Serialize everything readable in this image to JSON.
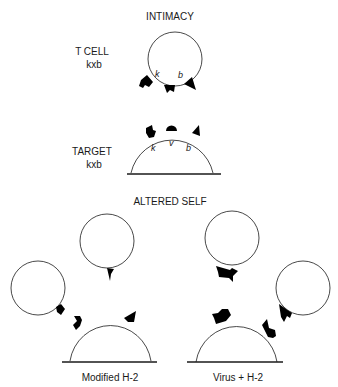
{
  "title": "INTIMACY",
  "intimacy": {
    "tcell": {
      "label_line1": "T CELL",
      "label_line2": "kxb",
      "markers": [
        "k",
        "b"
      ]
    },
    "target": {
      "label_line1": "TARGET",
      "label_line2": "kxb",
      "markers": [
        "k",
        "v",
        "b"
      ]
    }
  },
  "altered_self": {
    "title": "ALTERED SELF",
    "left": {
      "caption": "Modified H-2"
    },
    "right": {
      "caption": "Virus + H-2"
    }
  },
  "colors": {
    "stroke": "#1a1a1a",
    "fill": "#ffffff",
    "receptor": "#000000"
  }
}
